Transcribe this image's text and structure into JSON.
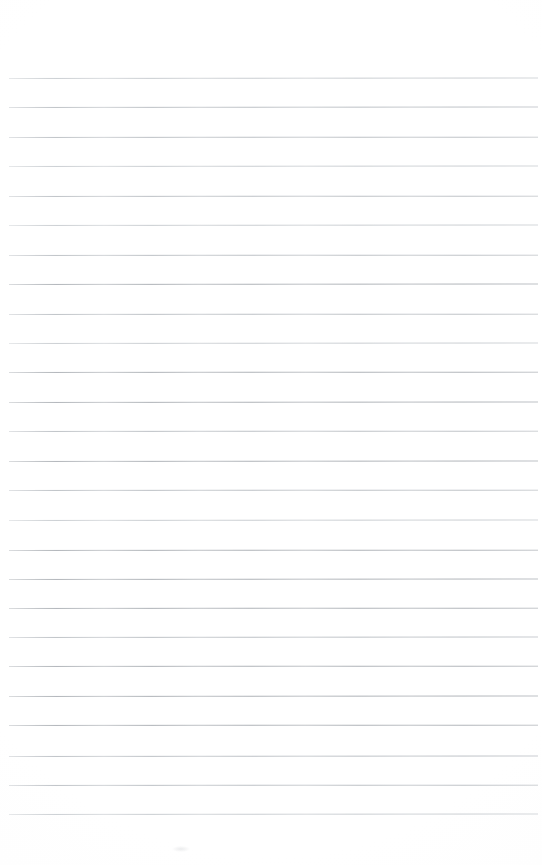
{
  "document": {
    "kind": "lined-paper-scan",
    "title": "Blank lined notepad page",
    "page_width": 542,
    "page_height": 865,
    "background_color": "#ffffff",
    "written_text": "",
    "top_margin_px": 78,
    "bottom_margin_px": 51,
    "left_margin_px": 9,
    "right_margin_px": 4
  },
  "ruling": {
    "line_count": 26,
    "line_spacing_px": 29.4,
    "first_line_y": 78,
    "last_line_y": 814,
    "line_start_x": 9,
    "line_end_x": 538,
    "line_thickness_px": 1,
    "line_color": "#b9bdc2",
    "line_color_light": "#c9cdd1",
    "line_color_dark": "#aeb2b7",
    "lines": [
      {
        "index": 1,
        "y": 78,
        "x1": 9,
        "x2": 538,
        "tone": "faint",
        "tilt_deg": -0.06
      },
      {
        "index": 2,
        "y": 107,
        "x1": 9,
        "x2": 538,
        "tone": "mid",
        "tilt_deg": -0.05
      },
      {
        "index": 3,
        "y": 137,
        "x1": 9,
        "x2": 538,
        "tone": "mid",
        "tilt_deg": -0.04
      },
      {
        "index": 4,
        "y": 166,
        "x1": 9,
        "x2": 538,
        "tone": "faint",
        "tilt_deg": -0.05
      },
      {
        "index": 5,
        "y": 196,
        "x1": 9,
        "x2": 538,
        "tone": "mid",
        "tilt_deg": -0.04
      },
      {
        "index": 6,
        "y": 225,
        "x1": 9,
        "x2": 538,
        "tone": "faint",
        "tilt_deg": -0.05
      },
      {
        "index": 7,
        "y": 255,
        "x1": 9,
        "x2": 538,
        "tone": "mid",
        "tilt_deg": -0.04
      },
      {
        "index": 8,
        "y": 284,
        "x1": 9,
        "x2": 538,
        "tone": "dark",
        "tilt_deg": -0.05
      },
      {
        "index": 9,
        "y": 314,
        "x1": 9,
        "x2": 538,
        "tone": "mid",
        "tilt_deg": -0.04
      },
      {
        "index": 10,
        "y": 343,
        "x1": 9,
        "x2": 538,
        "tone": "faint",
        "tilt_deg": -0.05
      },
      {
        "index": 11,
        "y": 372,
        "x1": 9,
        "x2": 538,
        "tone": "dark",
        "tilt_deg": -0.04
      },
      {
        "index": 12,
        "y": 402,
        "x1": 9,
        "x2": 538,
        "tone": "dark",
        "tilt_deg": -0.05
      },
      {
        "index": 13,
        "y": 431,
        "x1": 9,
        "x2": 538,
        "tone": "mid",
        "tilt_deg": -0.04
      },
      {
        "index": 14,
        "y": 461,
        "x1": 9,
        "x2": 538,
        "tone": "dark",
        "tilt_deg": -0.05
      },
      {
        "index": 15,
        "y": 490,
        "x1": 9,
        "x2": 538,
        "tone": "mid",
        "tilt_deg": -0.04
      },
      {
        "index": 16,
        "y": 520,
        "x1": 9,
        "x2": 538,
        "tone": "faint",
        "tilt_deg": -0.05
      },
      {
        "index": 17,
        "y": 550,
        "x1": 9,
        "x2": 538,
        "tone": "dark",
        "tilt_deg": -0.04
      },
      {
        "index": 18,
        "y": 579,
        "x1": 9,
        "x2": 538,
        "tone": "dark",
        "tilt_deg": -0.05
      },
      {
        "index": 19,
        "y": 608,
        "x1": 9,
        "x2": 538,
        "tone": "dark",
        "tilt_deg": -0.04
      },
      {
        "index": 20,
        "y": 637,
        "x1": 9,
        "x2": 538,
        "tone": "mid",
        "tilt_deg": -0.05
      },
      {
        "index": 21,
        "y": 666,
        "x1": 9,
        "x2": 538,
        "tone": "dark",
        "tilt_deg": -0.04
      },
      {
        "index": 22,
        "y": 696,
        "x1": 9,
        "x2": 538,
        "tone": "dark",
        "tilt_deg": -0.05
      },
      {
        "index": 23,
        "y": 725,
        "x1": 9,
        "x2": 538,
        "tone": "dark",
        "tilt_deg": -0.04
      },
      {
        "index": 24,
        "y": 756,
        "x1": 9,
        "x2": 538,
        "tone": "mid",
        "tilt_deg": -0.05
      },
      {
        "index": 25,
        "y": 785,
        "x1": 9,
        "x2": 538,
        "tone": "mid",
        "tilt_deg": -0.04
      },
      {
        "index": 26,
        "y": 814,
        "x1": 9,
        "x2": 538,
        "tone": "faint",
        "tilt_deg": -0.05
      }
    ]
  }
}
